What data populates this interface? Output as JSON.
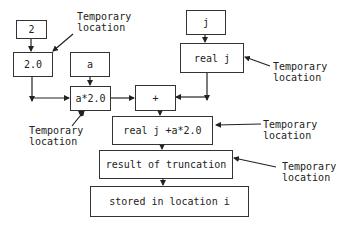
{
  "diagram": {
    "nodes": [
      {
        "id": "n2",
        "label": "2"
      },
      {
        "id": "n2_0",
        "label": "2.0"
      },
      {
        "id": "na",
        "label": "a"
      },
      {
        "id": "na_times",
        "label": "a*2.0"
      },
      {
        "id": "nplus",
        "label": "+"
      },
      {
        "id": "nj",
        "label": "j"
      },
      {
        "id": "nrealj",
        "label": "real j"
      },
      {
        "id": "nsum",
        "label": "real j +a*2.0"
      },
      {
        "id": "ntrunc",
        "label": "result of truncation"
      },
      {
        "id": "nstore",
        "label": "stored in location i"
      }
    ],
    "annotations": [
      {
        "line1": "Temporary",
        "line2": "location",
        "target": "2.0"
      },
      {
        "line1": "Temporary",
        "line2": "location",
        "target": "real j"
      },
      {
        "line1": "Temporary",
        "line2": "location",
        "target": "a*2.0"
      },
      {
        "line1": "Temporary",
        "line2": "location",
        "target": "real j +a*2.0"
      },
      {
        "line1": "Temporary",
        "line2": "location",
        "target": "result of truncation"
      }
    ],
    "edges": [
      [
        "2",
        "2.0"
      ],
      [
        "2.0",
        "a*2.0"
      ],
      [
        "a",
        "a*2.0"
      ],
      [
        "a*2.0",
        "+"
      ],
      [
        "j",
        "real j"
      ],
      [
        "real j",
        "+"
      ],
      [
        "+",
        "real j +a*2.0"
      ],
      [
        "real j +a*2.0",
        "result of truncation"
      ],
      [
        "result of truncation",
        "stored in location i"
      ]
    ],
    "colors": {
      "line": "#222222",
      "box_border": "#333333",
      "text": "#222222"
    }
  }
}
